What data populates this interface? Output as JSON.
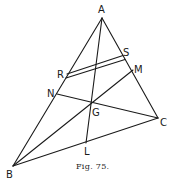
{
  "figure": {
    "caption": "Fig. 75.",
    "points": {
      "A": {
        "label": "A",
        "x": 102,
        "y": 18
      },
      "B": {
        "label": "B",
        "x": 13,
        "y": 166
      },
      "C": {
        "label": "C",
        "x": 158,
        "y": 118
      },
      "G": {
        "label": "G",
        "x": 91,
        "y": 102
      },
      "L": {
        "label": "L",
        "x": 86,
        "y": 143
      },
      "M": {
        "label": "M",
        "x": 133,
        "y": 70
      },
      "N": {
        "label": "N",
        "x": 57,
        "y": 94
      },
      "R": {
        "label": "R",
        "x": 66,
        "y": 76
      },
      "S": {
        "label": "S",
        "x": 124,
        "y": 58
      }
    },
    "segments": [
      [
        "A",
        "B"
      ],
      [
        "A",
        "C"
      ],
      [
        "B",
        "C"
      ],
      [
        "A",
        "L"
      ],
      [
        "B",
        "M"
      ],
      [
        "C",
        "N"
      ],
      [
        "R",
        "S"
      ]
    ]
  }
}
